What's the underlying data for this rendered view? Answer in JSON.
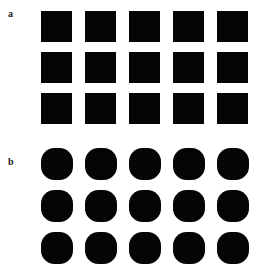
{
  "figure": {
    "background_color": "#ffffff",
    "shape_color": "#050505",
    "label_color": "#1a1a1a",
    "width": 269,
    "height": 273
  },
  "panels": [
    {
      "id": "a",
      "label": "a",
      "shape_kind": "square",
      "columns": 5,
      "rows": 3,
      "count": 15
    },
    {
      "id": "b",
      "label": "b",
      "shape_kind": "circle",
      "columns": 5,
      "rows": 3,
      "count": 15
    }
  ]
}
